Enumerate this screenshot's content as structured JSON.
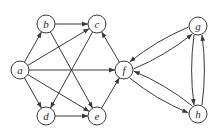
{
  "graph": {
    "type": "directed",
    "nodes": [
      {
        "id": "a",
        "label": "a"
      },
      {
        "id": "b",
        "label": "b"
      },
      {
        "id": "c",
        "label": "c"
      },
      {
        "id": "d",
        "label": "d"
      },
      {
        "id": "e",
        "label": "e"
      },
      {
        "id": "f",
        "label": "f"
      },
      {
        "id": "g",
        "label": "g"
      },
      {
        "id": "h",
        "label": "h"
      }
    ],
    "edges": [
      {
        "from": "a",
        "to": "b"
      },
      {
        "from": "a",
        "to": "c"
      },
      {
        "from": "a",
        "to": "f"
      },
      {
        "from": "a",
        "to": "d"
      },
      {
        "from": "a",
        "to": "e"
      },
      {
        "from": "b",
        "to": "c"
      },
      {
        "from": "b",
        "to": "e"
      },
      {
        "from": "c",
        "to": "d"
      },
      {
        "from": "d",
        "to": "e"
      },
      {
        "from": "e",
        "to": "f"
      },
      {
        "from": "f",
        "to": "c"
      },
      {
        "from": "f",
        "to": "g"
      },
      {
        "from": "g",
        "to": "f"
      },
      {
        "from": "f",
        "to": "h"
      },
      {
        "from": "h",
        "to": "f"
      },
      {
        "from": "g",
        "to": "h"
      },
      {
        "from": "h",
        "to": "g"
      }
    ]
  }
}
